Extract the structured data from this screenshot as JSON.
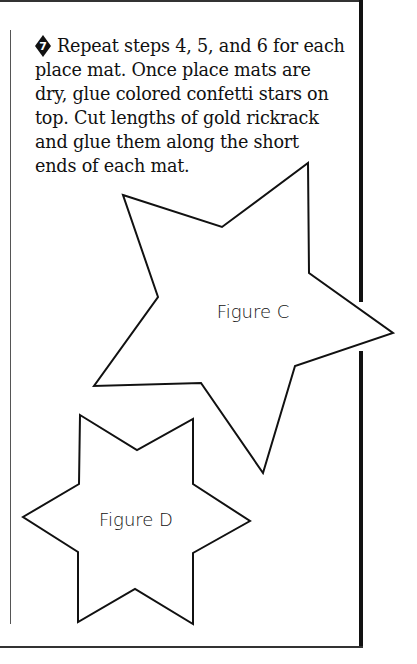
{
  "step": {
    "number": "7",
    "badge_icon": "diamond-number-icon",
    "lines": [
      "Repeat steps 4, 5, and 6 for each",
      "place mat. Once place mats are",
      "dry, glue colored confetti stars on",
      "top. Cut lengths of gold rickrack",
      "and glue them along the short",
      "ends of each mat."
    ]
  },
  "figures": [
    {
      "label": "Figure C",
      "shape": "five-point-star-outline"
    },
    {
      "label": "Figure D",
      "shape": "six-point-star-outline"
    }
  ],
  "colors": {
    "ink": "#111111",
    "page": "#ffffff"
  }
}
